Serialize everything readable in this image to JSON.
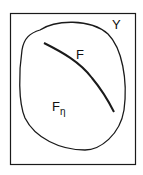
{
  "diagram": {
    "set_label": "Y",
    "subset_label_base": "F",
    "subset_label_sub": "η",
    "curve_label": "F",
    "stroke_color": "#1a1a1a",
    "background": "#ffffff"
  }
}
